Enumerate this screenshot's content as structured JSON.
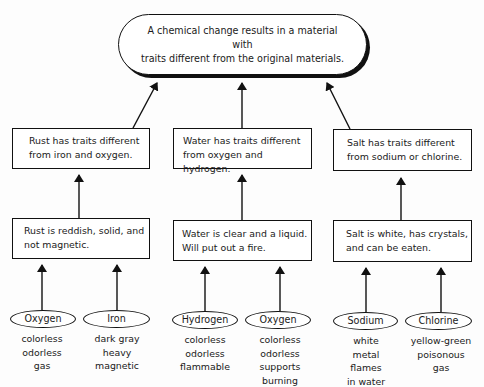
{
  "diagram": {
    "title_node": {
      "line1": "A chemical change results in a material with",
      "line2": "traits different from the original materials."
    },
    "columns": [
      {
        "compound": "Rust",
        "summary": {
          "line1": "Rust has traits different",
          "line2": "from iron and oxygen."
        },
        "description": {
          "line1": "Rust is reddish, solid, and",
          "line2": "not magnetic."
        },
        "elements": [
          {
            "name": "Oxygen",
            "traits": [
              "colorless",
              "odorless",
              "gas"
            ]
          },
          {
            "name": "Iron",
            "traits": [
              "dark gray",
              "heavy",
              "magnetic"
            ]
          }
        ]
      },
      {
        "compound": "Water",
        "summary": {
          "line1": "Water has traits different",
          "line2": "from oxygen and hydrogen."
        },
        "description": {
          "line1": "Water is clear and a liquid.",
          "line2": "Will put out a fire."
        },
        "elements": [
          {
            "name": "Hydrogen",
            "traits": [
              "colorless",
              "odorless",
              "flammable"
            ]
          },
          {
            "name": "Oxygen",
            "traits": [
              "colorless",
              "odorless",
              "supports",
              "burning"
            ]
          }
        ]
      },
      {
        "compound": "Salt",
        "summary": {
          "line1": "Salt has traits different",
          "line2": "from sodium or chlorine."
        },
        "description": {
          "line1": "Salt is white, has crystals,",
          "line2": "and can be eaten."
        },
        "elements": [
          {
            "name": "Sodium",
            "traits": [
              "white",
              "metal",
              "flames",
              "in water"
            ]
          },
          {
            "name": "Chlorine",
            "traits": [
              "yellow-green",
              "poisonous",
              "gas"
            ]
          }
        ]
      }
    ],
    "colors": {
      "line": "#111111",
      "background": "#fdfdfd",
      "text": "#1a1a1a"
    }
  }
}
